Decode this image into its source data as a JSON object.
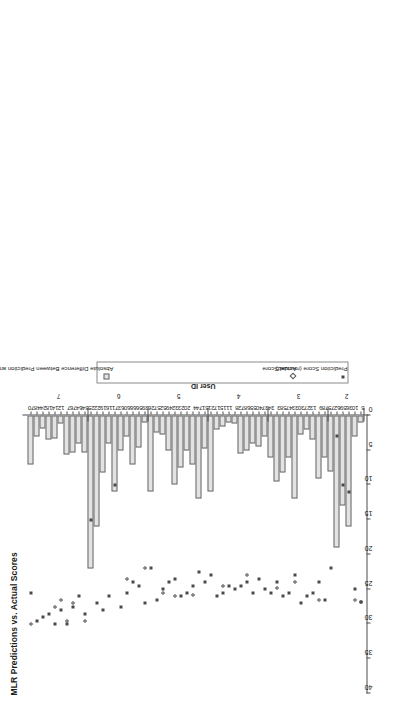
{
  "chart_data": {
    "type": "bar",
    "title": "MLR Predictions vs. Actual Scores",
    "orientation": "horizontal",
    "xlabel": "",
    "ylabel": "User ID\nk-fold set",
    "axis_title_line1": "User ID",
    "axis_title_line2": "k-fold set",
    "value_axis_label": "",
    "value_ticks": [
      "0",
      "5",
      "10",
      "15",
      "20",
      "25",
      "30",
      "35",
      "40"
    ],
    "value_tick_values": [
      0,
      5,
      10,
      15,
      20,
      25,
      30,
      35,
      40
    ],
    "xlim": [
      0,
      40
    ],
    "grid": false,
    "legend_position": "right",
    "legend": [
      {
        "label": "Absolute Difference Between Prediction and Actual Score",
        "marker": "bar-swatch",
        "color": "#e3e3e3"
      },
      {
        "label": "Actual Score",
        "marker": "open-diamond",
        "color": "#555555"
      },
      {
        "label": "Prediction Score (rounded)",
        "marker": "filled-square",
        "color": "#4a4a4a"
      }
    ],
    "series": [
      {
        "name": "Absolute Difference Between Prediction and Actual Score",
        "type": "bar"
      },
      {
        "name": "Actual Score",
        "type": "scatter"
      },
      {
        "name": "Prediction Score (rounded)",
        "type": "scatter"
      }
    ],
    "group_label_name": "k-fold set",
    "groups": [
      {
        "fold": "7",
        "user_ids": [
          "70",
          "48",
          "24",
          "18",
          "14",
          "12",
          "7",
          "76",
          "64",
          "54"
        ]
      },
      {
        "fold": "6",
        "user_ids": [
          "25",
          "22",
          "19",
          "16",
          "71",
          "63",
          "60",
          "66",
          "56",
          "39"
        ]
      },
      {
        "fold": "5",
        "user_ids": [
          "26",
          "57",
          "52",
          "49",
          "32",
          "23",
          "20",
          "4",
          "74",
          "51"
        ]
      },
      {
        "fold": "4",
        "user_ids": [
          "21",
          "17",
          "15",
          "11",
          "8",
          "72",
          "68",
          "55",
          "40",
          "37"
        ]
      },
      {
        "fold": "3",
        "user_ids": [
          "34",
          "3",
          "58",
          "47",
          "33",
          "30",
          "27",
          "13",
          "9",
          "78"
        ]
      },
      {
        "fold": "2",
        "user_ids": [
          "75",
          "62",
          "59",
          "36",
          "10",
          "5",
          "1",
          "2",
          "6",
          "28"
        ]
      },
      {
        "fold": "1",
        "user_ids": [
          "29",
          "31",
          "35",
          "38",
          "41",
          "42",
          "43",
          "44",
          "45",
          "46"
        ]
      },
      {
        "fold": "0",
        "user_ids": [
          "50",
          "53",
          "61",
          "65",
          "67",
          "69",
          "73",
          "77",
          "79",
          "80"
        ]
      }
    ],
    "categories": [
      "70",
      "48",
      "24",
      "18",
      "14",
      "12",
      "7",
      "76",
      "64",
      "54",
      "25",
      "22",
      "19",
      "16",
      "71",
      "63",
      "60",
      "66",
      "56",
      "39",
      "26",
      "57",
      "52",
      "49",
      "32",
      "23",
      "20",
      "4",
      "74",
      "51",
      "21",
      "17",
      "15",
      "11",
      "8",
      "72",
      "68",
      "55",
      "40",
      "37",
      "34",
      "3",
      "58",
      "47",
      "33",
      "30",
      "27",
      "13",
      "9",
      "78",
      "75",
      "62",
      "59",
      "36",
      "10",
      "5"
    ],
    "bars_abs_difference": [
      7.0,
      3.0,
      1.9,
      3.4,
      3.3,
      1.1,
      5.6,
      5.3,
      4.1,
      5.3,
      22.0,
      16.0,
      8.2,
      4.0,
      11.0,
      5.1,
      3.0,
      7.0,
      4.6,
      1.0,
      11.0,
      2.5,
      2.8,
      5.0,
      10.0,
      7.5,
      5.0,
      7.0,
      12.0,
      4.8,
      11.0,
      2.0,
      1.6,
      1.0,
      1.1,
      5.5,
      5.0,
      4.1,
      4.5,
      3.0,
      6.0,
      9.5,
      8.2,
      6.0,
      12.0,
      2.8,
      2.0,
      3.4,
      9.0,
      6.0,
      8.0,
      19.0,
      13.0,
      16.0,
      3.0,
      1.0
    ],
    "points_actual_score": [
      30.0,
      null,
      null,
      null,
      27.5,
      26.5,
      29.5,
      27.0,
      null,
      29.5,
      null,
      null,
      null,
      null,
      null,
      null,
      23.5,
      null,
      null,
      22.0,
      null,
      null,
      25.5,
      null,
      26.0,
      null,
      null,
      25.8,
      null,
      null,
      null,
      null,
      24.5,
      null,
      null,
      null,
      23.0,
      null,
      null,
      null,
      null,
      24.8,
      null,
      null,
      24.0,
      null,
      null,
      null,
      26.5,
      null,
      null,
      null,
      null,
      null,
      26.5,
      26.8
    ],
    "points_prediction_score": [
      25.5,
      29.5,
      29.0,
      28.5,
      30.0,
      28.0,
      30.0,
      27.5,
      26.0,
      28.5,
      15.0,
      27.0,
      28.0,
      26.0,
      10.0,
      27.5,
      25.5,
      24.0,
      24.5,
      27.0,
      22.0,
      26.5,
      25.0,
      24.0,
      23.5,
      26.0,
      25.5,
      24.5,
      22.5,
      24.0,
      23.0,
      26.0,
      25.5,
      24.5,
      25.0,
      24.5,
      24.0,
      25.5,
      23.5,
      25.0,
      25.5,
      24.0,
      26.0,
      25.5,
      23.0,
      27.0,
      26.0,
      25.5,
      24.0,
      26.5,
      22.0,
      3.0,
      10.0,
      11.0,
      25.0,
      26.8
    ]
  }
}
